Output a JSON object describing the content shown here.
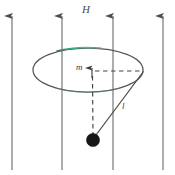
{
  "figure": {
    "type": "physics-diagram",
    "width": 175,
    "height": 175,
    "background_color": "#ffffff",
    "labels": {
      "field": "H",
      "mass": "m",
      "length": "l"
    },
    "colors": {
      "line": "#555555",
      "dark_line": "#3a3a3a",
      "green_arc": "#2fa98a",
      "bob_fill": "#1a1a1a",
      "dashed": "#4a4a4a"
    },
    "field_lines": {
      "count": 4,
      "x_positions": [
        12,
        62,
        113,
        163
      ],
      "y_top": 14,
      "y_bottom": 170,
      "arrow_direction": "up",
      "label": "H"
    },
    "orbit_ellipse": {
      "center_x": 88,
      "center_y": 70,
      "radius_x": 55,
      "radius_y": 22,
      "highlight": "top-arc-green"
    },
    "center_point": {
      "x": 92,
      "y": 72,
      "label": "m",
      "arrow_direction": "up"
    },
    "radius_dashed_line": {
      "from_x": 93,
      "from_y": 71,
      "to_x": 143,
      "to_y": 71
    },
    "axis_dashed_line": {
      "from_x": 92,
      "from_y": 72,
      "to_x": 93,
      "to_y": 138
    },
    "string": {
      "from_x": 93,
      "from_y": 140,
      "to_x": 143,
      "to_y": 72,
      "label": "l"
    },
    "bob": {
      "center_x": 93,
      "center_y": 140,
      "radius": 6.5
    }
  }
}
